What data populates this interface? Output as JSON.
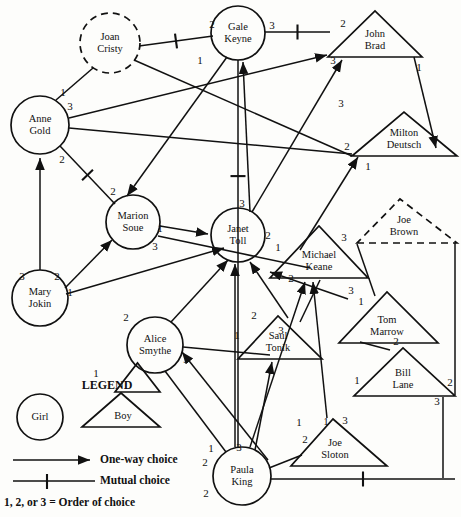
{
  "legend": {
    "heading": "LEGEND",
    "girl_label": "Girl",
    "boy_label": "Boy",
    "oneway_label": "One-way choice",
    "mutual_label": "Mutual choice",
    "order_note": "1, 2, or 3 = Order of choice"
  },
  "colors": {
    "ink": "#111111",
    "paper": "#fdfdfb"
  },
  "nodes": [
    {
      "id": "joan",
      "name": "Joan Cristy",
      "line1": "Joan",
      "line2": "Cristy",
      "gender": "girl",
      "shape": "circle",
      "style": "dashed",
      "cx": 110,
      "cy": 43,
      "r": 30
    },
    {
      "id": "gale",
      "name": "Gale Keyne",
      "line1": "Gale",
      "line2": "Keyne",
      "gender": "girl",
      "shape": "circle",
      "style": "solid",
      "cx": 238,
      "cy": 33,
      "r": 27
    },
    {
      "id": "john",
      "name": "John Brad",
      "line1": "John",
      "line2": "Brad",
      "gender": "boy",
      "shape": "triangle",
      "style": "solid",
      "cx": 375,
      "cy": 40,
      "apex_x": 375,
      "apex_y": 11,
      "left_x": 328,
      "right_x": 422,
      "base_y": 57
    },
    {
      "id": "anne",
      "name": "Anne Gold",
      "line1": "Anne",
      "line2": "Gold",
      "gender": "girl",
      "shape": "circle",
      "style": "solid",
      "cx": 40,
      "cy": 125,
      "r": 29
    },
    {
      "id": "milton",
      "name": "Milton Deutsch",
      "line1": "Milton",
      "line2": "Deutsch",
      "gender": "boy",
      "shape": "triangle",
      "style": "solid",
      "cx": 404,
      "cy": 140,
      "apex_x": 404,
      "apex_y": 112,
      "left_x": 352,
      "right_x": 457,
      "base_y": 156
    },
    {
      "id": "marion",
      "name": "Marion Soue",
      "line1": "Marion",
      "line2": "Soue",
      "gender": "girl",
      "shape": "circle",
      "style": "solid",
      "cx": 133,
      "cy": 222,
      "r": 27
    },
    {
      "id": "janet",
      "name": "Janet Toll",
      "line1": "Janet",
      "line2": "Toll",
      "gender": "girl",
      "shape": "circle",
      "style": "solid",
      "cx": 238,
      "cy": 235,
      "r": 27
    },
    {
      "id": "joebrown",
      "name": "Joe Brown",
      "line1": "Joe",
      "line2": "Brown",
      "gender": "boy",
      "shape": "triangle",
      "style": "dashed",
      "cx": 404,
      "cy": 228,
      "apex_x": 400,
      "apex_y": 199,
      "left_x": 357,
      "right_x": 457,
      "base_y": 243
    },
    {
      "id": "michael",
      "name": "Michael Keane",
      "line1": "Michael",
      "line2": "Keane",
      "gender": "boy",
      "shape": "triangle",
      "style": "solid",
      "cx": 319,
      "cy": 258,
      "apex_x": 319,
      "apex_y": 226,
      "left_x": 270,
      "right_x": 368,
      "base_y": 278
    },
    {
      "id": "mary",
      "name": "Mary Jokin",
      "line1": "Mary",
      "line2": "Jokin",
      "gender": "girl",
      "shape": "circle",
      "style": "solid",
      "cx": 40,
      "cy": 298,
      "r": 28
    },
    {
      "id": "tom",
      "name": "Tom Marrow",
      "line1": "Tom",
      "line2": "Marrow",
      "gender": "boy",
      "shape": "triangle",
      "style": "solid",
      "cx": 387,
      "cy": 325,
      "apex_x": 387,
      "apex_y": 292,
      "left_x": 339,
      "right_x": 438,
      "base_y": 343
    },
    {
      "id": "alice",
      "name": "Alice Smythe",
      "line1": "Alice",
      "line2": "Smythe",
      "gender": "girl",
      "shape": "circle",
      "style": "solid",
      "cx": 155,
      "cy": 345,
      "r": 28
    },
    {
      "id": "saul",
      "name": "Saul Tonik",
      "line1": "Saul",
      "line2": "Tonik",
      "gender": "boy",
      "shape": "triangle",
      "style": "solid",
      "cx": 278,
      "cy": 340,
      "apex_x": 278,
      "apex_y": 316,
      "left_x": 238,
      "right_x": 322,
      "base_y": 359
    },
    {
      "id": "bill",
      "name": "Bill Lane",
      "line1": "Bill",
      "line2": "Lane",
      "gender": "boy",
      "shape": "triangle",
      "style": "solid",
      "cx": 403,
      "cy": 380,
      "apex_x": 403,
      "apex_y": 348,
      "left_x": 354,
      "right_x": 455,
      "base_y": 396
    },
    {
      "id": "joeslot",
      "name": "Joe Sloton",
      "line1": "Joe",
      "line2": "Sloton",
      "gender": "boy",
      "shape": "triangle",
      "style": "solid",
      "cx": 335,
      "cy": 447,
      "apex_x": 333,
      "apex_y": 419,
      "left_x": 291,
      "right_x": 387,
      "base_y": 466
    },
    {
      "id": "paula",
      "name": "Paula King",
      "line1": "Paula",
      "line2": "King",
      "gender": "girl",
      "shape": "circle",
      "style": "solid",
      "cx": 242,
      "cy": 476,
      "r": 29
    }
  ],
  "order_labels": [
    {
      "text": "2",
      "x": 212,
      "y": 25
    },
    {
      "text": "3",
      "x": 272,
      "y": 26
    },
    {
      "text": "2",
      "x": 343,
      "y": 24
    },
    {
      "text": "1",
      "x": 419,
      "y": 68
    },
    {
      "text": "1",
      "x": 200,
      "y": 61
    },
    {
      "text": "3",
      "x": 333,
      "y": 61
    },
    {
      "text": "1",
      "x": 63,
      "y": 93
    },
    {
      "text": "3",
      "x": 70,
      "y": 107
    },
    {
      "text": "3",
      "x": 341,
      "y": 104
    },
    {
      "text": "2",
      "x": 347,
      "y": 147
    },
    {
      "text": "1",
      "x": 368,
      "y": 167
    },
    {
      "text": "2",
      "x": 62,
      "y": 160
    },
    {
      "text": "2",
      "x": 113,
      "y": 192
    },
    {
      "text": "3",
      "x": 242,
      "y": 204
    },
    {
      "text": "1",
      "x": 160,
      "y": 229
    },
    {
      "text": "3",
      "x": 155,
      "y": 247
    },
    {
      "text": "2",
      "x": 268,
      "y": 236
    },
    {
      "text": "1",
      "x": 278,
      "y": 248
    },
    {
      "text": "3",
      "x": 344,
      "y": 238
    },
    {
      "text": "3",
      "x": 22,
      "y": 277
    },
    {
      "text": "2",
      "x": 57,
      "y": 277
    },
    {
      "text": "1",
      "x": 70,
      "y": 293
    },
    {
      "text": "2",
      "x": 291,
      "y": 279
    },
    {
      "text": "3",
      "x": 351,
      "y": 291
    },
    {
      "text": "1",
      "x": 361,
      "y": 302
    },
    {
      "text": "2",
      "x": 126,
      "y": 318
    },
    {
      "text": "2",
      "x": 254,
      "y": 316
    },
    {
      "text": "1",
      "x": 237,
      "y": 336
    },
    {
      "text": "3",
      "x": 281,
      "y": 331
    },
    {
      "text": "2",
      "x": 396,
      "y": 342
    },
    {
      "text": "3",
      "x": 186,
      "y": 360
    },
    {
      "text": "1",
      "x": 96,
      "y": 374
    },
    {
      "text": "1",
      "x": 357,
      "y": 381
    },
    {
      "text": "2",
      "x": 450,
      "y": 383
    },
    {
      "text": "3",
      "x": 437,
      "y": 402
    },
    {
      "text": "1",
      "x": 326,
      "y": 422
    },
    {
      "text": "3",
      "x": 345,
      "y": 421
    },
    {
      "text": "2",
      "x": 305,
      "y": 440
    },
    {
      "text": "1",
      "x": 211,
      "y": 449
    },
    {
      "text": "3",
      "x": 239,
      "y": 448
    },
    {
      "text": "2",
      "x": 205,
      "y": 463
    },
    {
      "text": "2",
      "x": 206,
      "y": 494
    },
    {
      "text": "1",
      "x": 299,
      "y": 423
    }
  ],
  "edges": [
    {
      "from": "joan",
      "to": "gale",
      "type": "mutual",
      "path": "M 139 46 L 213 36"
    },
    {
      "from": "joan",
      "to": "anne",
      "type": "plain",
      "path": "M 93 68 L 56 100"
    },
    {
      "from": "joan",
      "to": "milton",
      "type": "plain",
      "path": "M 134 60 L 352 156"
    },
    {
      "from": "anne",
      "to": "john",
      "type": "arrow",
      "path": "M 69 118 L 327 55"
    },
    {
      "from": "anne",
      "to": "milton",
      "type": "plain",
      "path": "M 69 128 L 352 154"
    },
    {
      "from": "anne",
      "to": "marion",
      "type": "mutual",
      "path": "M 60 146 L 115 204"
    },
    {
      "from": "mary",
      "to": "anne",
      "type": "arrow",
      "path": "M 40 270 L 40 158"
    },
    {
      "from": "mary",
      "to": "marion",
      "type": "arrow",
      "path": "M 65 288 L 112 240"
    },
    {
      "from": "mary",
      "to": "janet",
      "type": "arrow",
      "path": "M 66 294 L 224 248"
    },
    {
      "from": "gale",
      "to": "john",
      "type": "mutual",
      "path": "M 265 32 L 330 32"
    },
    {
      "from": "gale",
      "to": "paula",
      "type": "mutual-v",
      "path": "M 238 60 L 238 447"
    },
    {
      "from": "gale",
      "to": "marion",
      "type": "arrow",
      "path": "M 227 57 L 127 196"
    },
    {
      "from": "john",
      "to": "milton",
      "type": "arrow",
      "path": "M 414 57 L 436 148"
    },
    {
      "from": "janet",
      "to": "gale",
      "type": "arrow",
      "path": "M 250 212 L 243 62"
    },
    {
      "from": "janet",
      "to": "john",
      "type": "arrow",
      "path": "M 252 212 L 342 60"
    },
    {
      "from": "michael",
      "to": "milton",
      "type": "arrow",
      "path": "M 300 250 L 358 157"
    },
    {
      "from": "marion",
      "to": "janet",
      "type": "arrow",
      "path": "M 160 226 L 208 234"
    },
    {
      "from": "marion",
      "to": "michael",
      "type": "plain",
      "path": "M 158 236 L 310 268"
    },
    {
      "from": "alice",
      "to": "janet",
      "type": "arrow",
      "path": "M 171 322 L 228 260"
    },
    {
      "from": "alice",
      "to": "saul",
      "type": "plain",
      "path": "M 183 347 L 270 355"
    },
    {
      "from": "alice",
      "to": "paula",
      "type": "plain",
      "path": "M 165 371 L 226 452"
    },
    {
      "from": "paula",
      "to": "janet",
      "type": "arrow",
      "path": "M 235 447 L 235 264"
    },
    {
      "from": "paula",
      "to": "alice",
      "type": "arrow",
      "path": "M 268 460 L 182 352"
    },
    {
      "from": "paula",
      "to": "michael",
      "type": "arrow",
      "path": "M 250 447 L 305 282"
    },
    {
      "from": "paula",
      "to": "saul",
      "type": "arrow",
      "path": "M 255 450 L 272 362"
    },
    {
      "from": "paula",
      "to": "bill",
      "type": "mutual",
      "path": "M 271 479 L 455 479"
    },
    {
      "from": "joeslot",
      "to": "michael",
      "type": "arrow",
      "path": "M 327 418 L 313 282"
    },
    {
      "from": "joeslot",
      "to": "paula",
      "type": "plain",
      "path": "M 302 455 L 269 468"
    },
    {
      "from": "saul",
      "to": "janet",
      "type": "arrow",
      "path": "M 288 318 L 250 262"
    },
    {
      "from": "saul",
      "to": "michael",
      "type": "plain",
      "path": "M 300 322 L 320 280"
    },
    {
      "from": "tom",
      "to": "michael",
      "type": "arrow",
      "path": "M 348 299 L 270 272"
    },
    {
      "from": "tom",
      "to": "joebrown",
      "type": "plain",
      "path": "M 375 296 L 357 244"
    },
    {
      "from": "bill",
      "to": "tom",
      "type": "plain",
      "path": "M 390 350 L 360 342"
    },
    {
      "from": "joebrown",
      "to": "bill",
      "type": "plain",
      "path": "M 455 243 L 455 395"
    },
    {
      "from": "bill",
      "to": "paula",
      "type": "plain",
      "path": "M 443 397 L 443 478"
    }
  ]
}
